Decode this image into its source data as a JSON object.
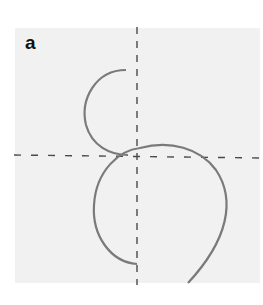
{
  "figure": {
    "panel_label": "a",
    "colors": {
      "background": "#ffffff",
      "panel": "#f1f1f1",
      "curve": "#7a7a7a",
      "axes": "#4a4a4a"
    },
    "axes": {
      "vertical_x": 137,
      "horizontal_y": 155,
      "style": "dashed"
    },
    "curves": [
      {
        "name": "upper-semicircle",
        "path": "M 126 70 C 95 70, 80 100, 86 125 C 92 146, 110 155, 128 155"
      },
      {
        "name": "lower-loop",
        "path": "M 137 264 C 110 262, 92 235, 94 205 C 96 170, 120 150, 140 148 C 170 140, 200 148, 216 170 C 236 200, 228 240, 188 283"
      }
    ]
  }
}
